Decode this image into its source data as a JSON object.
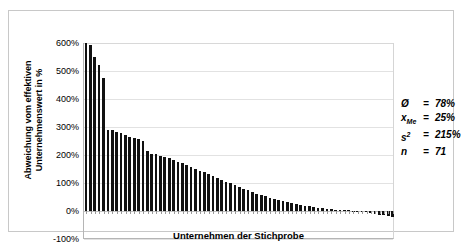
{
  "chart_data": {
    "type": "bar",
    "title": "",
    "xlabel": "Unternehmen der Stichprobe",
    "ylabel": "Abweichung vom effektiven Unternehmenswert in %",
    "ylabel_line1": "Abweichung vom effektiven",
    "ylabel_line2": "Unternehmenswert in %",
    "ylim": [
      -100,
      600
    ],
    "ytick_step": 100,
    "ytick_labels": [
      "600%",
      "500%",
      "400%",
      "300%",
      "200%",
      "100%",
      "0%",
      "-100%"
    ],
    "ytick_values": [
      600,
      500,
      400,
      300,
      200,
      100,
      0,
      -100
    ],
    "grid": true,
    "legend": "none",
    "bar_color": "#111111",
    "categories_count": 71,
    "xtick_labels": [],
    "values": [
      600,
      592,
      551,
      520,
      475,
      290,
      288,
      283,
      277,
      272,
      266,
      261,
      256,
      250,
      216,
      205,
      202,
      198,
      193,
      188,
      182,
      176,
      170,
      164,
      157,
      150,
      144,
      138,
      131,
      125,
      118,
      112,
      105,
      99,
      92,
      86,
      80,
      74,
      68,
      62,
      57,
      52,
      47,
      43,
      39,
      35,
      31,
      28,
      25,
      22,
      19,
      17,
      14,
      12,
      10,
      8,
      6,
      5,
      4,
      3,
      2,
      1,
      0,
      -2,
      -4,
      -7,
      -10,
      -13,
      -16,
      -19,
      -22
    ]
  },
  "stats": {
    "rows": [
      {
        "symbol": "Ø",
        "eq": "=",
        "value": "78%"
      },
      {
        "symbol": "x",
        "sub": "Me",
        "eq": "=",
        "value": "25%"
      },
      {
        "symbol": "s",
        "sup": "2",
        "eq": "=",
        "value": "215%"
      },
      {
        "symbol": "n",
        "eq": "=",
        "value": "71"
      }
    ],
    "mean_label": "Ø",
    "mean_value": "78%",
    "median_label": "x",
    "median_sub": "Me",
    "median_value": "25%",
    "variance_label": "s",
    "variance_sup": "2",
    "variance_value": "215%",
    "count_label": "n",
    "count_value": "71"
  }
}
